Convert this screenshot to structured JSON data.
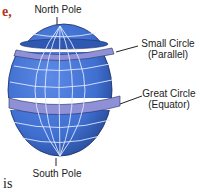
{
  "document_fragments": {
    "top_left": "e,",
    "bottom_left": "is"
  },
  "diagram": {
    "labels": {
      "north_pole": "North Pole",
      "small_circle_line1": "Small Circle",
      "small_circle_line2": "(Parallel)",
      "great_circle_line1": "Great Circle",
      "great_circle_line2": "(Equator)",
      "south_pole": "South Pole"
    },
    "colors": {
      "globe_fill": "#3f6fd0",
      "globe_dark": "#2a4f9e",
      "grid_lines": "#dfe8ff",
      "band_fill": "#8f90d6",
      "outline": "#1f2f66",
      "fragment_text": "#b5361c",
      "label_text": "#222222"
    }
  }
}
